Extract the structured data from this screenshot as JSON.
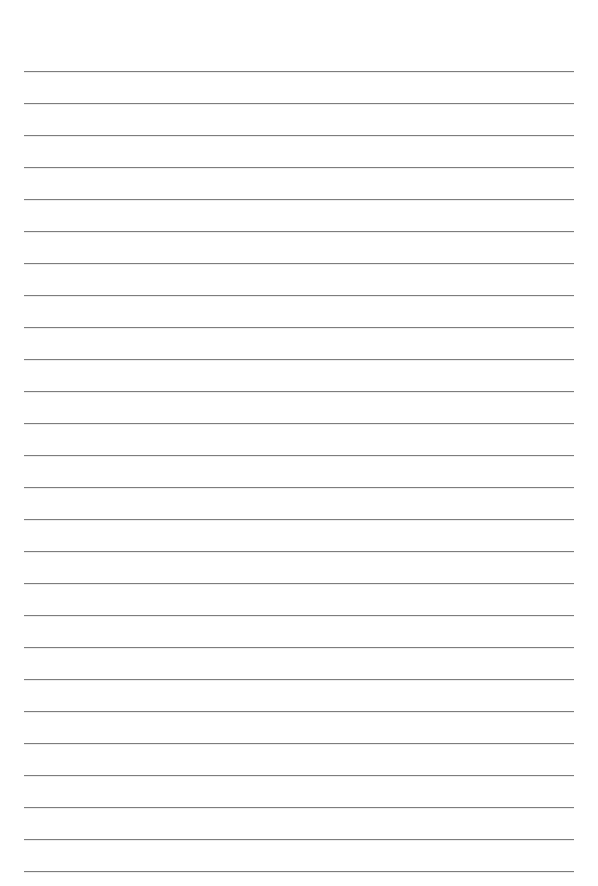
{
  "page": {
    "type": "lined-paper",
    "background_color": "#ffffff",
    "line_color": "#7d7d7d",
    "line_count": 26,
    "first_line_y": 71,
    "line_spacing": 32,
    "line_left": 24,
    "line_width": 550
  }
}
